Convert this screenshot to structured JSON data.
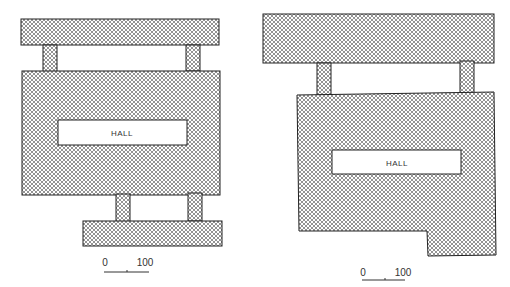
{
  "colors": {
    "hatch": "#555555",
    "outline": "#222222",
    "background": "#ffffff"
  },
  "plans": [
    {
      "name": "plan-left",
      "hall_label": "HALL",
      "scale": {
        "start": "0",
        "end": "100"
      }
    },
    {
      "name": "plan-right",
      "hall_label": "HALL",
      "scale": {
        "start": "0",
        "end": "100"
      }
    }
  ]
}
